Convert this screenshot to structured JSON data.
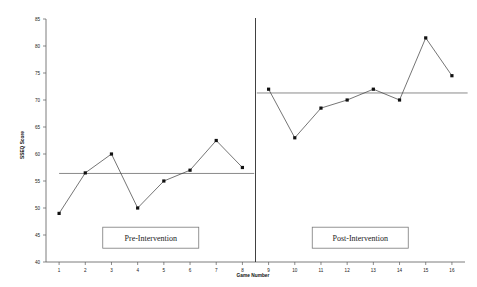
{
  "chart_data": {
    "type": "line",
    "title": "",
    "xlabel": "Game Number",
    "ylabel": "SSEQ Score",
    "xlim": [
      0.5,
      16.5
    ],
    "ylim": [
      40,
      85
    ],
    "ytick_labels": [
      "40",
      "45",
      "50",
      "55",
      "60",
      "65",
      "70",
      "75",
      "80",
      "85"
    ],
    "ytick_values": [
      40,
      45,
      50,
      55,
      60,
      65,
      70,
      75,
      80,
      85
    ],
    "xtick_labels": [
      "1",
      "2",
      "3",
      "4",
      "5",
      "6",
      "7",
      "8",
      "9",
      "10",
      "11",
      "12",
      "13",
      "14",
      "15",
      "16"
    ],
    "xtick_values": [
      1,
      2,
      3,
      4,
      5,
      6,
      7,
      8,
      9,
      10,
      11,
      12,
      13,
      14,
      15,
      16
    ],
    "grid": false,
    "legend": "none",
    "series": [
      {
        "name": "Pre-Intervention",
        "x": [
          1,
          2,
          3,
          4,
          5,
          6,
          7,
          8
        ],
        "values": [
          49,
          56.5,
          60,
          50,
          55,
          57,
          62.5,
          57.5
        ]
      },
      {
        "name": "Post-Intervention",
        "x": [
          9,
          10,
          11,
          12,
          13,
          14,
          15,
          16
        ],
        "values": [
          72,
          63,
          68.5,
          70,
          72,
          70,
          81.5,
          74.5
        ]
      }
    ],
    "annotations": [
      {
        "name": "pre-phase-mean",
        "type": "mean_line",
        "value": 56.4,
        "x_from": 1,
        "x_to": 8.45
      },
      {
        "name": "post-phase-mean",
        "type": "mean_line",
        "value": 71.3,
        "x_from": 8.55,
        "x_to": 16.6
      },
      {
        "name": "phase-change-line",
        "type": "vline",
        "value": 8.5
      }
    ],
    "phase_labels": [
      {
        "text": "Pre-Intervention",
        "x": 4.5,
        "y": 44.5
      },
      {
        "text": "Post-Intervention",
        "x": 12.5,
        "y": 44.5
      }
    ]
  },
  "axis": {
    "y_title": "SSEQ Score",
    "x_title": "Game Number"
  }
}
